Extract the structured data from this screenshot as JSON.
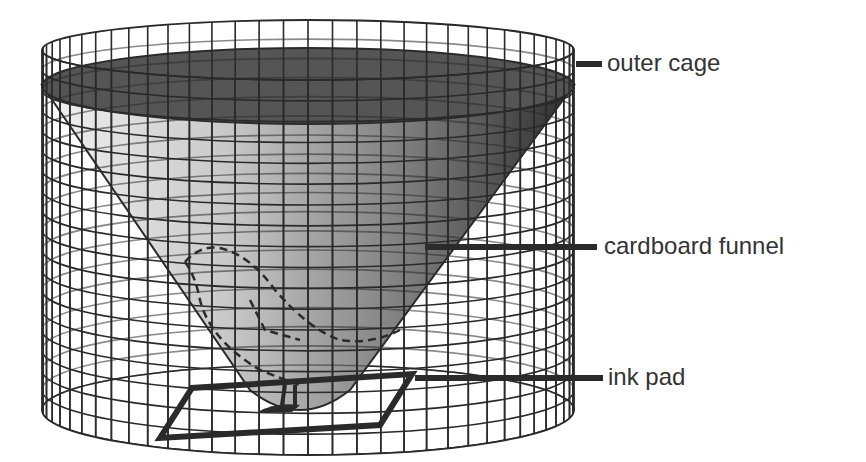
{
  "diagram": {
    "labels": {
      "outer_cage": "outer cage",
      "cardboard_funnel": "cardboard funnel",
      "ink_pad": "ink pad"
    },
    "colors": {
      "background": "#ffffff",
      "grid_line": "#2a2a2a",
      "funnel_rim": "#555555",
      "funnel_dark": "#3a3a3a",
      "funnel_light": "#d8d8d8",
      "label_text": "#333333",
      "leader_line": "#2a2a2a"
    }
  }
}
